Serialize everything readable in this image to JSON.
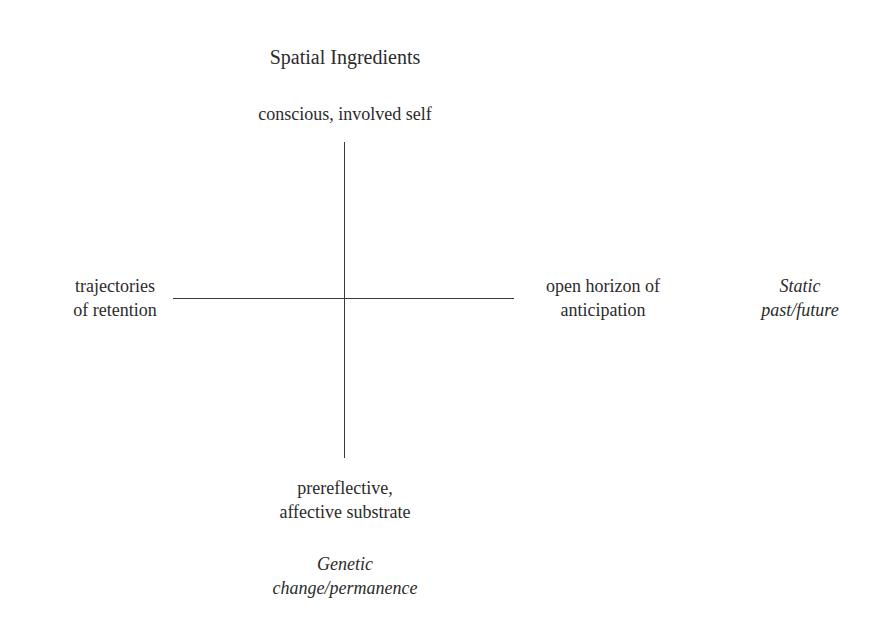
{
  "diagram": {
    "title": "Spatial Ingredients",
    "axes": {
      "top": "conscious, involved self",
      "bottom_line1": "prereflective,",
      "bottom_line2": "affective substrate",
      "left_line1": "trajectories",
      "left_line2": "of retention",
      "right_line1": "open horizon of",
      "right_line2": "anticipation"
    },
    "dimension_labels": {
      "horizontal_line1": "Static",
      "horizontal_line2": "past/future",
      "vertical_line1": "Genetic",
      "vertical_line2": "change/permanence"
    },
    "colors": {
      "line": "#3a3a3a",
      "text": "#2b2b2b",
      "background": "#ffffff"
    }
  }
}
